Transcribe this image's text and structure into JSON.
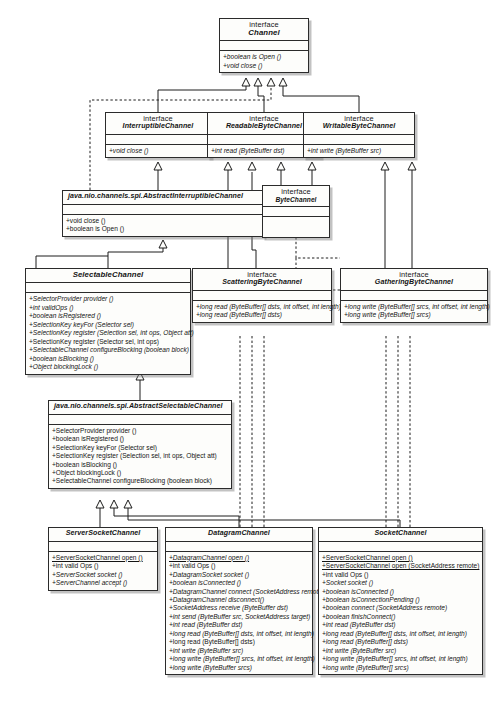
{
  "diagram": {
    "type": "uml-class-diagram",
    "stereotype_label": "interface",
    "classes": [
      {
        "id": "channel",
        "name": "Channel",
        "stereotype": "interface",
        "operations": [
          "+boolean is Open ()",
          "+void close ()"
        ]
      },
      {
        "id": "interruptiblechannel",
        "name": "InterruptibleChannel",
        "stereotype": "interface",
        "operations": [
          "+void close ()"
        ]
      },
      {
        "id": "readablebytechannel",
        "name": "ReadableByteChannel",
        "stereotype": "interface",
        "operations": [
          "+int read (ByteBuffer dst)"
        ]
      },
      {
        "id": "writablebytechannel",
        "name": "WritableByteChannel",
        "stereotype": "interface",
        "operations": [
          "+int write (ByteBuffer src)"
        ]
      },
      {
        "id": "abstractinterruptiblechannel",
        "name": "java.nio.channels.spi.AbstractInterruptibleChannel",
        "stereotype": "",
        "operations": [
          "+void close ()",
          "+boolean is Open ()"
        ]
      },
      {
        "id": "bytechannel",
        "name": "ByteChannel",
        "stereotype": "interface",
        "operations": []
      },
      {
        "id": "selectablechannel",
        "name": "SelectableChannel",
        "stereotype": "",
        "operations": [
          "+SelectorProvider provider ()",
          "+int validOps ()",
          "+boolean isRegistered ()",
          "+SelectionKey keyFor (Selector sel)",
          "+SelectionKey register (Selection sel, int ops, Object att)",
          "+SelectionKey register (Selector sel, int ops)",
          "+SelectableChannel configureBlocking (boolean block)",
          "+boolean isBlocking ()",
          "+Object blockingLock ()"
        ]
      },
      {
        "id": "scatteringbytechannel",
        "name": "ScatteringByteChannel",
        "stereotype": "interface",
        "operations": [
          "+long read (ByteBuffer[] dsts, int offset, int length)",
          "+long read (ByteBuffer[] dsts)"
        ]
      },
      {
        "id": "gatheringbytechannel",
        "name": "GatheringByteChannel",
        "stereotype": "interface",
        "operations": [
          "+long write (ByteBuffer[] srcs, int offset, int length)",
          "+long write (ByteBuffer[] srcs)"
        ]
      },
      {
        "id": "abstractselectablechannel",
        "name": "java.nio.channels.spi.AbstractSelectableChannel",
        "stereotype": "",
        "operations": [
          "+SelectorProvider provider ()",
          "+boolean isRegistered ()",
          "+SelectionKey keyFor (Selector sel)",
          "+SelectionKey register (Selection sel, int ops, Object att)",
          "+boolean isBlocking ()",
          "+Object blockingLock ()",
          "+SelectableChannel configureBlocking (boolean block)"
        ]
      },
      {
        "id": "serversocketchannel",
        "name": "ServerSocketChannel",
        "stereotype": "",
        "operations": [
          "+ServerSocketChannel open ()",
          "+int valid Ops ()",
          "+ServerSocket socket ()",
          "+ServerChannel accept ()"
        ]
      },
      {
        "id": "datagramchannel",
        "name": "DatagramChannel",
        "stereotype": "",
        "operations": [
          "+DatagramChannel open ()",
          "+int valid Ops ()",
          "+DatagramSocket socket ()",
          "+boolean isConnected ()",
          "+DatagramChannel connect (SocketAddress remote)",
          "+DatagramChannel disconnect()",
          "+SocketAddress receive (ByteBuffer dst)",
          "+int send (ByteBuffer src, SocketAddress target)",
          "+int read (ByteBuffer dst)",
          "+long read (ByteBuffer[] dsts, int offset, int length)",
          "+long read (ByteBuffer[] dsts)",
          "+int write (ByteBuffer src)",
          "+long write (ByteBuffer[] srcs, int offset, int length)",
          "+long write (ByteBuffer srcs)"
        ]
      },
      {
        "id": "socketchannel",
        "name": "SocketChannel",
        "stereotype": "",
        "operations": [
          "+ServerSocketChannel open ()",
          "+ServerSocketChannel open (SocketAddress remote)",
          "+int valid Ops ()",
          "+Socket socket ()",
          "+boolean isConnected ()",
          "+boolean isConnectionPending ()",
          "+boolean connect (SocketAddress remote)",
          "+boolean finishConnect()",
          "+int read (ByteBuffer dst)",
          "+long read (ByteBuffer[] dsts, int offset, int length)",
          "+long read (ByteBuffer[] dsts)",
          "+int write (ByteBuffer src)",
          "+long write (ByteBuffer[] srcs, int offset, int length)",
          "+long write (ByteBuffer[] srcs)"
        ]
      }
    ]
  }
}
